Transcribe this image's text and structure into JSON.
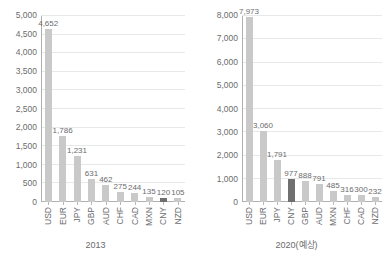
{
  "chart_data": [
    {
      "type": "bar",
      "title": "",
      "caption": "2013",
      "xlabel": "",
      "ylabel": "",
      "ylim": [
        0,
        5000
      ],
      "yticks": [
        "0",
        "500",
        "1,000",
        "1,500",
        "2,000",
        "2,500",
        "3,000",
        "3,500",
        "4,000",
        "4,500",
        "5,000"
      ],
      "ytick_values": [
        0,
        500,
        1000,
        1500,
        2000,
        2500,
        3000,
        3500,
        4000,
        4500,
        5000
      ],
      "grid": true,
      "legend": "none",
      "categories": [
        "USD",
        "EUR",
        "JPY",
        "GBP",
        "AUD",
        "CHF",
        "CAD",
        "MXN",
        "CNY",
        "NZD"
      ],
      "values": [
        4652,
        1786,
        1231,
        631,
        462,
        275,
        244,
        135,
        120,
        105
      ],
      "value_labels": [
        "4,652",
        "1,786",
        "1,231",
        "631",
        "462",
        "275",
        "244",
        "135",
        "120",
        "105"
      ],
      "highlight_category": "CNY",
      "bar_color": "#c9c9c9",
      "highlight_color": "#6f6f6f"
    },
    {
      "type": "bar",
      "title": "",
      "caption": "2020(예상)",
      "xlabel": "",
      "ylabel": "",
      "ylim": [
        0,
        8000
      ],
      "yticks": [
        "0",
        "1,000",
        "2,000",
        "3,000",
        "4,000",
        "5,000",
        "6,000",
        "7,000",
        "8,000"
      ],
      "ytick_values": [
        0,
        1000,
        2000,
        3000,
        4000,
        5000,
        6000,
        7000,
        8000
      ],
      "grid": true,
      "legend": "none",
      "categories": [
        "USD",
        "EUR",
        "JPY",
        "CNY",
        "GBP",
        "AUD",
        "MXN",
        "CHF",
        "CAD",
        "NZD"
      ],
      "values": [
        7973,
        3060,
        1791,
        977,
        888,
        791,
        485,
        316,
        300,
        232
      ],
      "value_labels": [
        "7,973",
        "3,060",
        "1,791",
        "977",
        "888",
        "791",
        "485",
        "316",
        "300",
        "232"
      ],
      "highlight_category": "CNY",
      "bar_color": "#c9c9c9",
      "highlight_color": "#6f6f6f"
    }
  ]
}
